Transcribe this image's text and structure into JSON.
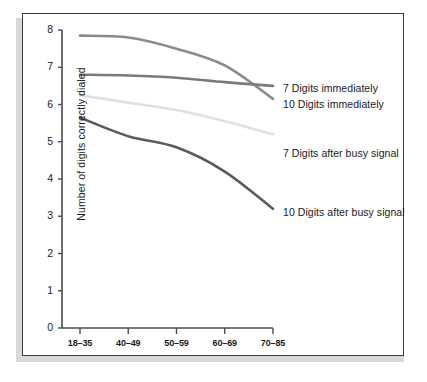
{
  "chart_data": {
    "type": "line",
    "title": "",
    "subtitle": "",
    "xlabel": "",
    "ylabel": "Number of digits correctly dialed",
    "categories": [
      "18–35",
      "40–49",
      "50–59",
      "60–69",
      "70–85"
    ],
    "ylim": [
      0,
      8
    ],
    "yticks": [
      0,
      1,
      2,
      3,
      4,
      5,
      6,
      7,
      8
    ],
    "ytick_labels": [
      "0",
      "1",
      "2",
      "3",
      "4",
      "5",
      "6",
      "7",
      "8"
    ],
    "grid": false,
    "legend_position": "right-inline-annotations",
    "series": [
      {
        "name": "7 Digits immediately",
        "color": "#8a8a8a",
        "values": [
          7.85,
          7.8,
          7.5,
          7.05,
          6.15
        ]
      },
      {
        "name": "10 Digits immediately",
        "color": "#7a7a7a",
        "values": [
          6.8,
          6.78,
          6.72,
          6.6,
          6.5
        ]
      },
      {
        "name": "7 Digits after busy signal",
        "color": "#e0e0e0",
        "values": [
          6.25,
          6.05,
          5.85,
          5.55,
          5.2
        ]
      },
      {
        "name": "10 Digits after busy signal",
        "color": "#5a5a5a",
        "values": [
          5.65,
          5.15,
          4.85,
          4.2,
          3.2
        ]
      }
    ],
    "annotations": [
      {
        "text": "7 Digits immediately",
        "x": 282,
        "y": 88
      },
      {
        "text": "10 Digits immediately",
        "x": 282,
        "y": 104
      },
      {
        "text": "7 Digits after busy signal",
        "x": 282,
        "y": 153
      },
      {
        "text": "10 Digits after busy signal",
        "x": 282,
        "y": 212
      }
    ]
  },
  "axes": {
    "y_axis_name": "y-axis",
    "x_axis_name": "x-axis"
  },
  "colors": {
    "frame_border": "#3b3b3b",
    "axis": "#4a4a4a",
    "text": "#1a1a1a",
    "background": "#ffffff",
    "shadow": "#d9d9d9"
  }
}
